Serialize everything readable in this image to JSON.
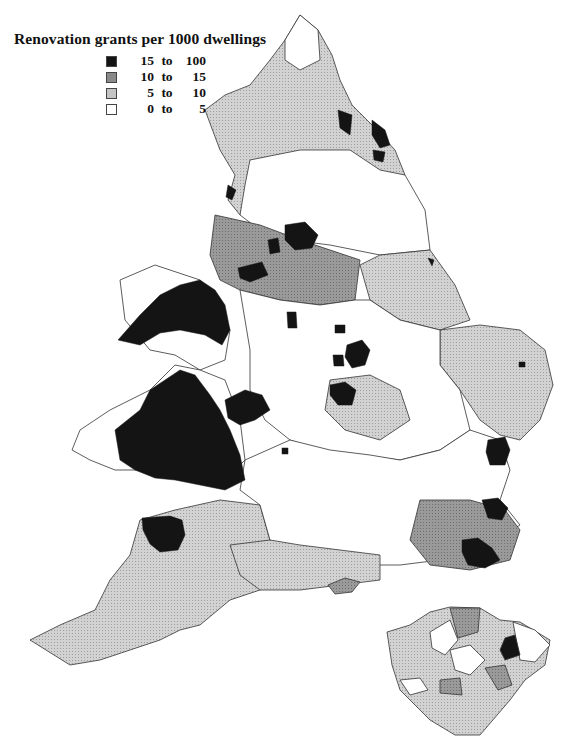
{
  "map": {
    "title": "Renovation grants per 1000 dwellings",
    "legend": [
      {
        "from": "15",
        "to_word": "to",
        "to": "100",
        "color": "#141414"
      },
      {
        "from": "10",
        "to_word": "to",
        "to": "15",
        "color": "#8a8a8a"
      },
      {
        "from": "5",
        "to_word": "to",
        "to": "10",
        "color": "#c4c4c4"
      },
      {
        "from": "0",
        "to_word": "to",
        "to": "5",
        "color": "#ffffff"
      }
    ],
    "main_region": "England and Wales (local authority districts)",
    "inset_region": "Greater London (boroughs)"
  }
}
